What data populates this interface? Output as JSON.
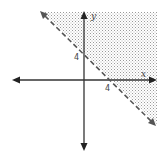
{
  "diagram": {
    "type": "linear-inequality-graph",
    "axes": {
      "x_label": "x",
      "y_label": "y"
    },
    "intercepts": {
      "x_intercept_label": "4",
      "y_intercept_label": "4"
    },
    "boundary_line": {
      "style": "dashed",
      "description": "line through (0,4) and (4,0)"
    },
    "shaded_region": "above-right of boundary line",
    "colors": {
      "axis": "#333333",
      "dashed_line": "#555555",
      "shade_dots": "#9a9a9a",
      "background": "#ffffff"
    }
  }
}
